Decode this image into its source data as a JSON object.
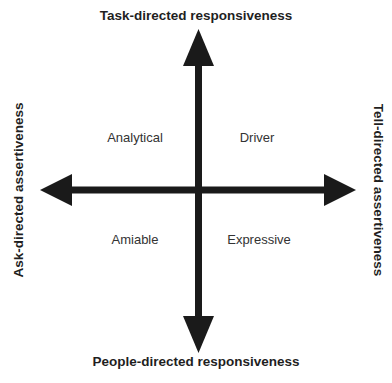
{
  "axes": {
    "top": "Task-directed responsiveness",
    "bottom": "People-directed responsiveness",
    "left": "Ask-directed assertiveness",
    "right": "Tell-directed assertiveness"
  },
  "quadrants": {
    "top_left": "Analytical",
    "top_right": "Driver",
    "bottom_left": "Amiable",
    "bottom_right": "Expressive"
  },
  "colors": {
    "arrow": "#1a1a1a",
    "text": "#1f1f1f",
    "background": "#ffffff"
  }
}
